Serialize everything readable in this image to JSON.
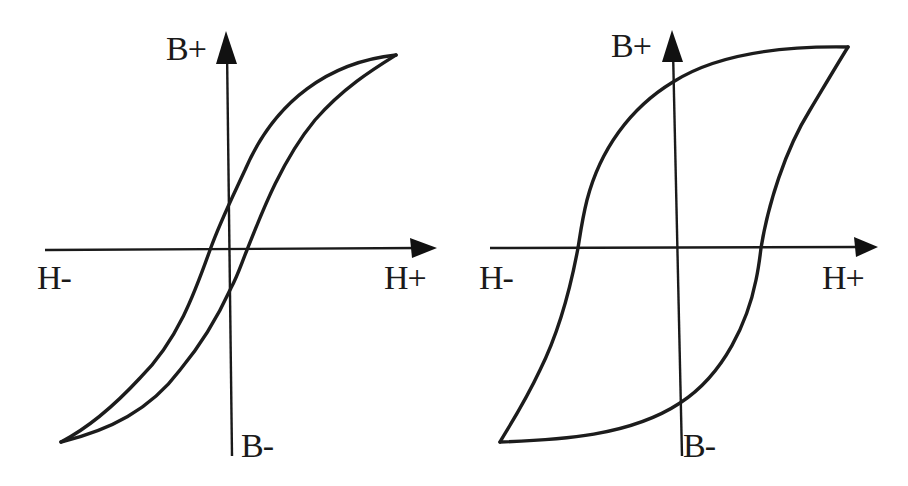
{
  "figure": {
    "line_color": "#1c1c1c",
    "background": "#ffffff"
  },
  "panels": [
    {
      "id": "narrow-loop",
      "loop_type": "narrow hysteresis loop",
      "labels": {
        "b_plus": "B+",
        "b_minus": "B-",
        "h_plus": "H+",
        "h_minus": "H-"
      },
      "key_points": {
        "saturation_positive": [
          396,
          55
        ],
        "saturation_negative": [
          61,
          442
        ],
        "remanence_positive": [
          228,
          205
        ],
        "remanence_negative": [
          231,
          288
        ],
        "coercivity_negative": [
          210,
          250
        ],
        "coercivity_positive": [
          245,
          250
        ]
      }
    },
    {
      "id": "wide-loop",
      "loop_type": "wide hysteresis loop",
      "labels": {
        "b_plus": "B+",
        "b_minus": "B-",
        "h_plus": "H+",
        "h_minus": "H-"
      },
      "key_points": {
        "saturation_positive": [
          848,
          47
        ],
        "saturation_negative": [
          500,
          442
        ],
        "remanence_positive": [
          673,
          82
        ],
        "remanence_negative": [
          680,
          403
        ],
        "coercivity_negative": [
          578,
          248
        ],
        "coercivity_positive": [
          760,
          248
        ]
      }
    }
  ]
}
